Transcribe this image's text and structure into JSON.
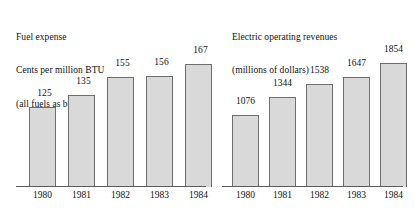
{
  "chart_data": [
    {
      "type": "bar",
      "title": "Fuel expense\nCents per million BTU\n(all fuels as burned)",
      "title_lines": [
        "Fuel expense",
        "Cents per million BTU",
        "(all fuels as burned)"
      ],
      "categories": [
        "1980",
        "1981",
        "1982",
        "1983",
        "1984"
      ],
      "values": [
        125,
        135,
        155,
        156,
        167
      ],
      "value_labels": [
        "125",
        "135",
        "155",
        "156",
        "167"
      ],
      "xlabel": "",
      "ylabel": "Cents per million BTU",
      "ylim": [
        0,
        190
      ],
      "axis_truncated": true,
      "grid": false,
      "legend": false,
      "bar_fill": "#d9d9d9",
      "bar_border": "#6e6e6e"
    },
    {
      "type": "bar",
      "title": "Electric operating revenues\n(millions of dollars)",
      "title_lines": [
        "Electric operating revenues",
        "(millions of dollars)"
      ],
      "categories": [
        "1980",
        "1981",
        "1982",
        "1983",
        "1984"
      ],
      "values": [
        1076,
        1344,
        1538,
        1647,
        1854
      ],
      "value_labels": [
        "1076",
        "1344",
        "1538",
        "1647",
        "1854"
      ],
      "xlabel": "",
      "ylabel": "millions of dollars",
      "ylim": [
        0,
        2000
      ],
      "axis_truncated": true,
      "grid": false,
      "legend": false,
      "bar_fill": "#d9d9d9",
      "bar_border": "#6e6e6e"
    }
  ],
  "layout": {
    "left": {
      "bars": [
        {
          "x": 29,
          "w": 27,
          "h": 80,
          "label_x": 29,
          "label_y": 88
        },
        {
          "x": 68,
          "w": 27,
          "h": 92,
          "label_x": 68,
          "label_y": 76
        },
        {
          "x": 107,
          "w": 27,
          "h": 110,
          "label_x": 107,
          "label_y": 58
        },
        {
          "x": 146,
          "w": 27,
          "h": 111,
          "label_x": 146,
          "label_y": 57
        },
        {
          "x": 185,
          "w": 27,
          "h": 123,
          "label_x": 185,
          "label_y": 45
        }
      ],
      "ticks": [
        {
          "x": 29,
          "w": 27
        },
        {
          "x": 68,
          "w": 27
        },
        {
          "x": 107,
          "w": 27
        },
        {
          "x": 146,
          "w": 27
        },
        {
          "x": 185,
          "w": 27
        }
      ]
    },
    "right": {
      "bars": [
        {
          "x": 22,
          "w": 27,
          "h": 72,
          "label_x": 20,
          "label_y": 96
        },
        {
          "x": 59,
          "w": 27,
          "h": 90,
          "label_x": 57,
          "label_y": 78
        },
        {
          "x": 96,
          "w": 27,
          "h": 103,
          "label_x": 94,
          "label_y": 65
        },
        {
          "x": 133,
          "w": 27,
          "h": 110,
          "label_x": 131,
          "label_y": 58
        },
        {
          "x": 170,
          "w": 27,
          "h": 124,
          "label_x": 168,
          "label_y": 44
        }
      ],
      "ticks": [
        {
          "x": 22,
          "w": 27
        },
        {
          "x": 59,
          "w": 27
        },
        {
          "x": 96,
          "w": 27
        },
        {
          "x": 133,
          "w": 27
        },
        {
          "x": 170,
          "w": 27
        }
      ]
    }
  }
}
